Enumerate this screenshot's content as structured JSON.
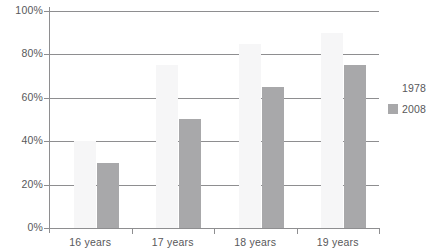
{
  "chart_data": {
    "type": "bar",
    "title": "",
    "subtitle": "",
    "xlabel": "",
    "ylabel": "",
    "categories": [
      "16 years",
      "17 years",
      "18 years",
      "19 years"
    ],
    "series": [
      {
        "name": "1978",
        "color": "#f6f6f7",
        "values": [
          40,
          75,
          85,
          90
        ]
      },
      {
        "name": "2008",
        "color": "#a8a8aa",
        "values": [
          30,
          50,
          65,
          75
        ]
      }
    ],
    "ylim": [
      0,
      100
    ],
    "ytick_values": [
      0,
      20,
      40,
      60,
      80,
      100
    ],
    "ytick_labels": [
      "0%",
      "20%",
      "40%",
      "60%",
      "80%",
      "100%"
    ],
    "grid": true,
    "legend_position": "right",
    "legend_entries": [
      {
        "label": "1978",
        "swatch": "#ffffff"
      },
      {
        "label": "2008",
        "swatch": "#a8a8aa"
      }
    ],
    "axis_color": "#8e8e90",
    "text_color": "#58585a",
    "background": "#ffffff"
  }
}
